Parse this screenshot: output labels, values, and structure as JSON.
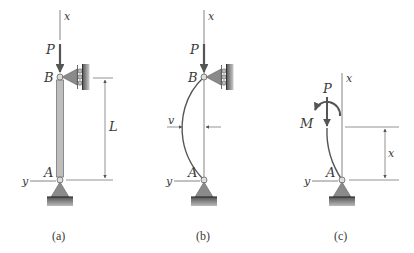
{
  "panels": [
    {
      "id": "a",
      "caption": "(a)",
      "labels": {
        "axis_top": "x",
        "axis_left": "y",
        "load": "P",
        "top_point": "B",
        "bottom_point": "A",
        "length": "L"
      }
    },
    {
      "id": "b",
      "caption": "(b)",
      "labels": {
        "axis_top": "x",
        "axis_left": "y",
        "load": "P",
        "top_point": "B",
        "bottom_point": "A",
        "deflection": "v"
      }
    },
    {
      "id": "c",
      "caption": "(c)",
      "labels": {
        "axis_top": "x",
        "axis_left": "y",
        "load": "P",
        "moment": "M",
        "bottom_point": "A",
        "distance": "x"
      }
    }
  ],
  "colors": {
    "line": "#555555",
    "column_fill": "#bdbdbd",
    "support_fill": "#8a8a8a",
    "ground_fill": "#6e6e6e",
    "text": "#3a3a3a"
  }
}
